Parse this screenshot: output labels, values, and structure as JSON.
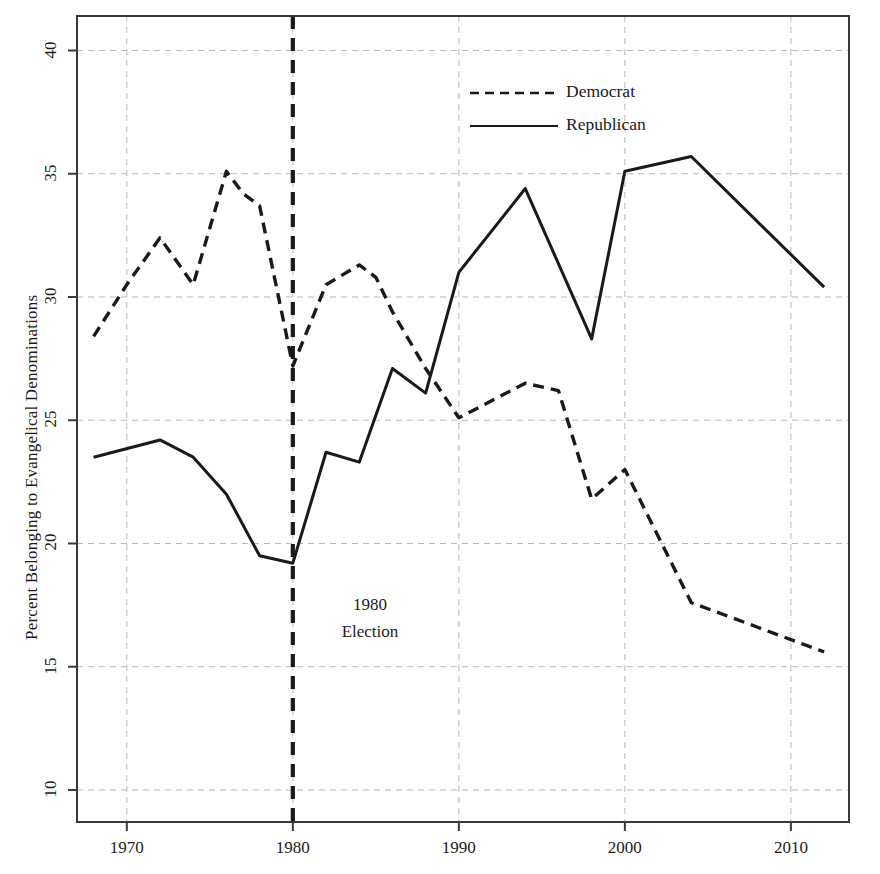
{
  "chart_data": {
    "type": "line",
    "title": "",
    "xlabel": "",
    "ylabel": "Percent Belonging to Evangelical Denominations",
    "xlim": [
      1967,
      2013.5
    ],
    "ylim": [
      8.7,
      41.4
    ],
    "xticks": [
      1970,
      1980,
      1990,
      2000,
      2010
    ],
    "xticklabels": [
      "1970",
      "1980",
      "1990",
      "2000",
      "2010"
    ],
    "yticks": [
      10,
      15,
      20,
      25,
      30,
      35,
      40
    ],
    "yticklabels": [
      "10",
      "15",
      "20",
      "25",
      "30",
      "35",
      "40"
    ],
    "grid": true,
    "grid_style": "dashed",
    "legend_position": "upper-center-right",
    "series": [
      {
        "name": "Democrat",
        "style": "dashed",
        "color": "#1a1a1a",
        "x": [
          1968,
          1970,
          1972,
          1974,
          1976,
          1977,
          1978,
          1980,
          1982,
          1984,
          1985,
          1986,
          1988,
          1990,
          1994,
          1996,
          1998,
          2000,
          2004,
          2008,
          2012
        ],
        "y": [
          28.4,
          30.5,
          32.4,
          30.5,
          35.1,
          34.2,
          33.7,
          27.2,
          30.5,
          31.3,
          30.8,
          29.4,
          27.1,
          25.1,
          26.5,
          26.2,
          21.8,
          23.0,
          17.6,
          16.6,
          15.6
        ]
      },
      {
        "name": "Republican",
        "style": "solid",
        "color": "#1a1a1a",
        "x": [
          1968,
          1972,
          1974,
          1976,
          1978,
          1980,
          1982,
          1984,
          1986,
          1988,
          1990,
          1994,
          1998,
          2000,
          2004,
          2012
        ],
        "y": [
          23.5,
          24.2,
          23.5,
          22.0,
          19.5,
          19.2,
          23.7,
          23.3,
          27.1,
          26.1,
          31.0,
          34.4,
          28.3,
          35.1,
          35.7,
          30.4
        ]
      }
    ],
    "annotations": [
      {
        "name": "election-marker",
        "type": "vline",
        "x": 1980,
        "style": "dashed-heavy",
        "label_line1": "1980",
        "label_line2": "Election"
      }
    ]
  },
  "legend": {
    "items": [
      {
        "label": "Democrat",
        "style": "dashed"
      },
      {
        "label": "Republican",
        "style": "solid"
      }
    ]
  },
  "annotation": {
    "line1": "1980",
    "line2": "Election"
  },
  "colors": {
    "line": "#1a1a1a",
    "grid": "#b9b9b9",
    "frame": "#3a3a3a",
    "background": "#ffffff"
  }
}
